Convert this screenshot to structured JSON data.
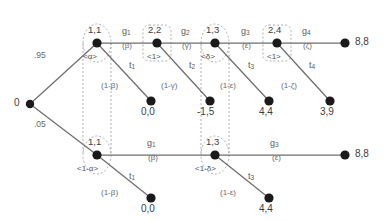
{
  "diagram": {
    "type": "game-tree",
    "colors": {
      "edge": "#6e6e6e",
      "node": "#1a1a1a",
      "infoset": "#9a9aa8",
      "text": "#4a4a4a"
    },
    "root": {
      "label": "0",
      "x": 30,
      "y": 104
    },
    "chance_edges": [
      {
        "name": "chance-high",
        "label": ".95",
        "x": 46,
        "y": 57
      },
      {
        "name": "chance-low",
        "label": ".05",
        "x": 46,
        "y": 126
      }
    ],
    "nodes": [
      {
        "id": "n-top-1",
        "label": "1,1",
        "belief": "<α>",
        "x": 97,
        "y": 43,
        "shape": "ellipse"
      },
      {
        "id": "n-top-2",
        "label": "2,2",
        "belief": "<1>",
        "x": 157,
        "y": 43,
        "shape": "rect"
      },
      {
        "id": "n-top-3",
        "label": "1,3",
        "belief": "<δ>",
        "x": 215,
        "y": 43,
        "shape": "ellipse"
      },
      {
        "id": "n-top-4",
        "label": "2,4",
        "belief": "<1>",
        "x": 277,
        "y": 43,
        "shape": "rect"
      },
      {
        "id": "n-bot-1",
        "label": "1,1",
        "belief": "<1-α>",
        "x": 97,
        "y": 155,
        "shape": "ellipse"
      },
      {
        "id": "n-bot-3",
        "label": "1,3",
        "belief": "<1-δ>",
        "x": 215,
        "y": 155,
        "shape": "ellipse"
      }
    ],
    "continue_edges": [
      {
        "name": "g1-top",
        "action": "g",
        "sub": "1",
        "prob": "(β)",
        "x": 128,
        "y": 33
      },
      {
        "name": "g2-top",
        "action": "g",
        "sub": "2",
        "prob": "(γ)",
        "x": 187,
        "y": 33
      },
      {
        "name": "g3-top",
        "action": "g",
        "sub": "3",
        "prob": "(ε)",
        "x": 247,
        "y": 33
      },
      {
        "name": "g4-top",
        "action": "g",
        "sub": "4",
        "prob": "(ζ)",
        "x": 307,
        "y": 33
      },
      {
        "name": "g1-bot",
        "action": "g",
        "sub": "1",
        "prob": "(β)",
        "x": 152,
        "y": 145
      },
      {
        "name": "g3-bot",
        "action": "g",
        "sub": "3",
        "prob": "(ε)",
        "x": 275,
        "y": 145
      }
    ],
    "stop_edges": [
      {
        "name": "t1-top",
        "action": "t",
        "sub": "1",
        "prob": "(1-β)",
        "lx": 133,
        "ly": 66,
        "px": 106,
        "py": 87
      },
      {
        "name": "t2-top",
        "action": "t",
        "sub": "2",
        "prob": "(1-γ)",
        "lx": 193,
        "ly": 66,
        "px": 166,
        "py": 87
      },
      {
        "name": "t3-top",
        "action": "t",
        "sub": "3",
        "prob": "(1-ε)",
        "lx": 252,
        "ly": 66,
        "px": 225,
        "py": 87
      },
      {
        "name": "t4-top",
        "action": "t",
        "sub": "4",
        "prob": "(1-ζ)",
        "lx": 313,
        "ly": 66,
        "px": 286,
        "py": 87
      },
      {
        "name": "t1-bot",
        "action": "t",
        "sub": "1",
        "prob": "(1-β)",
        "lx": 133,
        "ly": 177,
        "px": 106,
        "py": 196
      },
      {
        "name": "t3-bot",
        "action": "t",
        "sub": "3",
        "prob": "(1-ε)",
        "lx": 252,
        "ly": 177,
        "px": 225,
        "py": 196
      }
    ],
    "terminals": [
      {
        "id": "term-t1-top",
        "label": "0,0",
        "x": 154,
        "y": 112,
        "anchor": "below"
      },
      {
        "id": "term-t2-top",
        "label": "-1,5",
        "x": 213,
        "y": 112,
        "anchor": "below"
      },
      {
        "id": "term-t3-top",
        "label": "4,4",
        "x": 272,
        "y": 112,
        "anchor": "below"
      },
      {
        "id": "term-t4-top",
        "label": "3,9",
        "x": 333,
        "y": 112,
        "anchor": "below"
      },
      {
        "id": "term-g4-top",
        "label": "8,8",
        "x": 349,
        "y": 43,
        "anchor": "right"
      },
      {
        "id": "term-t1-bot",
        "label": "0,0",
        "x": 154,
        "y": 209,
        "anchor": "below"
      },
      {
        "id": "term-t3-bot",
        "label": "4,4",
        "x": 272,
        "y": 209,
        "anchor": "below"
      },
      {
        "id": "term-g3-bot",
        "label": "8,8",
        "x": 349,
        "y": 155,
        "anchor": "right"
      }
    ]
  }
}
